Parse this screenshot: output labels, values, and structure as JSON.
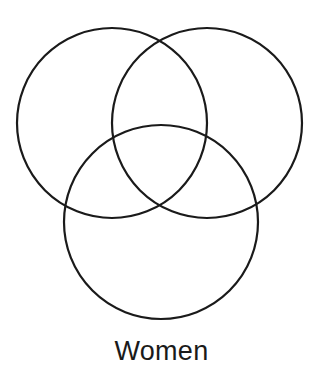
{
  "diagram": {
    "type": "venn",
    "stroke_color": "#1a1a1a",
    "stroke_width": 2.2,
    "circles": [
      {
        "name": "left",
        "cx": 112,
        "cy": 123,
        "r": 95
      },
      {
        "name": "right",
        "cx": 207,
        "cy": 123,
        "r": 95
      },
      {
        "name": "bottom",
        "cx": 161,
        "cy": 222,
        "r": 97
      }
    ],
    "label": "Women"
  }
}
